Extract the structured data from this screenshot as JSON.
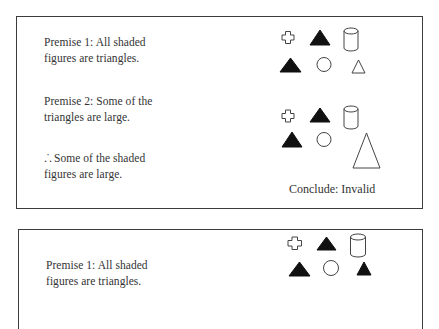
{
  "panels": [
    {
      "premise1": {
        "line1": "Premise 1: All shaded",
        "line2": "figures are triangles."
      },
      "premise2": {
        "line1": "Premise 2: Some of the",
        "line2": "triangles are large."
      },
      "conclusion": {
        "symbol": ".˙.",
        "line1": "Some of the shaded",
        "line2": "figures are large."
      },
      "figure_sets": [
        {
          "row1": [
            "cross-outline",
            "triangle-shaded",
            "cylinder-outline"
          ],
          "row2": [
            "triangle-shaded",
            "circle-outline",
            "triangle-outline-small"
          ]
        },
        {
          "row1": [
            "cross-outline",
            "triangle-shaded",
            "cylinder-outline"
          ],
          "row2": [
            "triangle-shaded",
            "circle-outline",
            "triangle-outline-large"
          ]
        }
      ],
      "verdict": "Conclude: Invalid"
    },
    {
      "premise1": {
        "line1": "Premise 1: All shaded",
        "line2": "figures are triangles."
      },
      "figure_sets": [
        {
          "row1": [
            "cross-outline",
            "triangle-shaded",
            "cylinder-outline"
          ],
          "row2": [
            "triangle-shaded",
            "circle-outline",
            "triangle-shaded-small"
          ]
        }
      ]
    }
  ],
  "colors": {
    "stroke": "#3c3c3c",
    "fill": "#111111",
    "text": "#333333",
    "background": "#ffffff"
  }
}
